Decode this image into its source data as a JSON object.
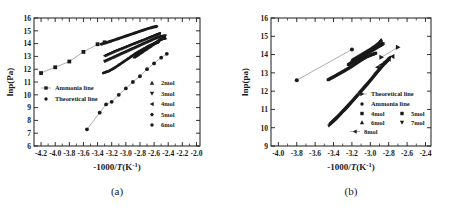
{
  "figure": {
    "panels": [
      {
        "caption": "(a)",
        "axes": {
          "xlabel_prefix": "-1000/",
          "xlabel_italic": "T",
          "xlabel_suffix_open": "(K",
          "xlabel_exp": "-1",
          "xlabel_suffix_close": ")",
          "ylabel": "lnp(Pa)",
          "xlim": [
            -4.3,
            -1.95
          ],
          "ylim": [
            6,
            16
          ],
          "xticks": [
            -4.2,
            -4.0,
            -3.8,
            -3.6,
            -3.4,
            -3.2,
            -3.0,
            -2.8,
            -2.6,
            -2.4,
            -2.2,
            -2.0
          ],
          "xticklabels": [
            "-4.2",
            "-4.0",
            "-3.8",
            "-3.6",
            "-3.4",
            "-3.2",
            "-3.0",
            "-2.8",
            "-2.6",
            "-2.4",
            "-2.2",
            "-2.0"
          ],
          "yticks": [
            6,
            7,
            8,
            9,
            10,
            11,
            12,
            13,
            14,
            15,
            16
          ],
          "yticklabels": [
            "6",
            "7",
            "8",
            "9",
            "10",
            "11",
            "12",
            "13",
            "14",
            "15",
            "16"
          ]
        },
        "legend_left": [
          {
            "label": "Ammonia line",
            "marker": "square",
            "line": true
          },
          {
            "label": "Theoretical line",
            "marker": "circle",
            "line": false
          }
        ],
        "legend_right": [
          {
            "label": "2mol",
            "marker": "triangle-up"
          },
          {
            "label": "3mol",
            "marker": "triangle-down"
          },
          {
            "label": "4mol",
            "marker": "triangle-left"
          },
          {
            "label": "5mol",
            "marker": "diamond"
          },
          {
            "label": "6mol",
            "marker": "circle"
          }
        ]
      },
      {
        "caption": "(b)",
        "axes": {
          "xlabel_prefix": "-1000/",
          "xlabel_italic": "T",
          "xlabel_suffix_open": "(K",
          "xlabel_exp": "-1",
          "xlabel_suffix_close": ")",
          "ylabel": "lnp(pa)",
          "xlim": [
            -4.08,
            -2.34
          ],
          "ylim": [
            9,
            16
          ],
          "xticks": [
            -4.0,
            -3.8,
            -3.6,
            -3.4,
            -3.2,
            -3.0,
            -2.8,
            -2.6,
            -2.4
          ],
          "xticklabels": [
            "-4.0",
            "-3.8",
            "-3.6",
            "-3.4",
            "-3.2",
            "-3.0",
            "-2.8",
            "-2.6",
            "-2.4"
          ],
          "yticks": [
            9,
            10,
            11,
            12,
            13,
            14,
            15,
            16
          ],
          "yticklabels": [
            "9",
            "10",
            "11",
            "12",
            "13",
            "14",
            "15",
            "16"
          ]
        },
        "legend_rows": [
          [
            {
              "label": "Theoretical line",
              "marker": "triangle-right",
              "line": true
            }
          ],
          [
            {
              "label": "Ammonia line",
              "marker": "circle",
              "line": false
            }
          ],
          [
            {
              "label": "4mol",
              "marker": "square"
            },
            {
              "label": "5mol",
              "marker": "square"
            }
          ],
          [
            {
              "label": "6mol",
              "marker": "triangle-up"
            },
            {
              "label": "7mol",
              "marker": "triangle-down"
            }
          ],
          [
            {
              "label": "8mol",
              "marker": "triangle-left",
              "line": true
            }
          ]
        ]
      }
    ]
  },
  "chart_data": [
    {
      "type": "scatter",
      "panel": "(a)",
      "title": "",
      "xlabel": "-1000/T(K^-1)",
      "ylabel": "lnp(Pa)",
      "xlim": [
        -4.3,
        -1.95
      ],
      "ylim": [
        6,
        16
      ],
      "grid": false,
      "legend_position": "inside-left and inside-right",
      "series": [
        {
          "name": "Ammonia line",
          "marker": "square",
          "line": true,
          "x": [
            -4.2,
            -4.0,
            -3.8,
            -3.6,
            -3.4,
            -3.3
          ],
          "y": [
            11.7,
            12.15,
            12.6,
            13.35,
            13.95,
            14.1
          ]
        },
        {
          "name": "Theoretical line",
          "marker": "circle",
          "line": true,
          "x": [
            -3.55,
            -3.37,
            -3.28,
            -3.2,
            -3.1,
            -3.0,
            -2.9,
            -2.8,
            -2.7,
            -2.6,
            -2.5,
            -2.42
          ],
          "y": [
            7.3,
            8.6,
            9.25,
            9.45,
            10.0,
            10.5,
            11.0,
            11.45,
            12.0,
            12.45,
            12.9,
            13.2
          ]
        },
        {
          "name": "2mol",
          "marker": "triangle-up",
          "line": false,
          "x": [
            -2.88,
            -2.84,
            -2.8,
            -2.76,
            -2.72,
            -2.68,
            -2.64,
            -2.6,
            -2.56,
            -2.52,
            -2.48,
            -2.44
          ],
          "y": [
            12.95,
            13.1,
            13.25,
            13.4,
            13.55,
            13.7,
            13.85,
            14.0,
            14.15,
            14.3,
            14.4,
            14.45
          ]
        },
        {
          "name": "3mol",
          "marker": "triangle-down",
          "line": false,
          "x": [
            -3.3,
            -3.22,
            -3.14,
            -3.06,
            -2.98,
            -2.9,
            -2.82,
            -2.74,
            -2.66,
            -2.58,
            -2.5,
            -2.44
          ],
          "y": [
            12.6,
            12.8,
            13.0,
            13.2,
            13.4,
            13.6,
            13.8,
            14.0,
            14.2,
            14.4,
            14.55,
            14.6
          ]
        },
        {
          "name": "4mol",
          "marker": "triangle-left",
          "line": false,
          "x": [
            -3.3,
            -3.22,
            -3.14,
            -3.06,
            -2.98,
            -2.9,
            -2.82,
            -2.74,
            -2.66,
            -2.58,
            -2.52
          ],
          "y": [
            13.05,
            13.25,
            13.45,
            13.62,
            13.8,
            13.98,
            14.15,
            14.32,
            14.5,
            14.68,
            14.8
          ]
        },
        {
          "name": "5mol",
          "marker": "diamond",
          "line": false,
          "x": [
            -3.35,
            -3.26,
            -3.18,
            -3.1,
            -3.02,
            -2.94,
            -2.86,
            -2.78,
            -2.7,
            -2.62,
            -2.56
          ],
          "y": [
            13.95,
            14.1,
            14.25,
            14.4,
            14.55,
            14.7,
            14.85,
            15.0,
            15.15,
            15.28,
            15.35
          ]
        },
        {
          "name": "6mol",
          "marker": "circle",
          "line": false,
          "x": [
            -3.32,
            -3.24,
            -3.16,
            -3.08,
            -3.0,
            -2.92,
            -2.84,
            -2.76,
            -2.68,
            -2.6,
            -2.54
          ],
          "y": [
            11.7,
            11.85,
            12.1,
            12.4,
            12.7,
            13.0,
            13.3,
            13.55,
            13.8,
            14.0,
            14.1
          ]
        }
      ]
    },
    {
      "type": "scatter",
      "panel": "(b)",
      "title": "",
      "xlabel": "-1000/T(K^-1)",
      "ylabel": "lnp(pa)",
      "xlim": [
        -4.08,
        -2.34
      ],
      "ylim": [
        9,
        16
      ],
      "grid": false,
      "legend_position": "inside-lower-right",
      "series": [
        {
          "name": "Ammonia line",
          "marker": "circle",
          "line": true,
          "x": [
            -3.8,
            -3.2
          ],
          "y": [
            12.6,
            14.28
          ]
        },
        {
          "name": "Theoretical line",
          "marker": "triangle-right",
          "line": true,
          "x": [
            -2.88,
            -2.7
          ],
          "y": [
            13.85,
            14.4
          ]
        },
        {
          "name": "4mol",
          "marker": "square",
          "line": false,
          "x": [
            -3.46,
            -3.4,
            -3.34,
            -3.28,
            -3.22,
            -3.16,
            -3.1,
            -3.04,
            -2.98,
            -2.94
          ],
          "y": [
            12.62,
            12.78,
            12.95,
            13.12,
            13.3,
            13.5,
            13.7,
            13.88,
            14.0,
            14.08
          ]
        },
        {
          "name": "5mol",
          "marker": "square",
          "line": false,
          "x": [
            -3.24,
            -3.19,
            -3.14,
            -3.09,
            -3.04,
            -2.99,
            -2.94,
            -2.89,
            -2.86
          ],
          "y": [
            13.45,
            13.6,
            13.75,
            13.9,
            14.05,
            14.2,
            14.35,
            14.5,
            14.6
          ]
        },
        {
          "name": "6mol",
          "marker": "triangle-up",
          "line": false,
          "x": [
            -3.2,
            -3.15,
            -3.1,
            -3.05,
            -3.0,
            -2.95,
            -2.9,
            -2.88
          ],
          "y": [
            13.7,
            13.85,
            14.0,
            14.15,
            14.3,
            14.48,
            14.68,
            14.8
          ]
        },
        {
          "name": "7mol",
          "marker": "triangle-down",
          "line": false,
          "x": [
            -3.45,
            -3.38,
            -3.31,
            -3.24,
            -3.17,
            -3.1,
            -3.03,
            -2.96,
            -2.9,
            -2.84,
            -2.8
          ],
          "y": [
            10.1,
            10.42,
            10.78,
            11.15,
            11.55,
            11.95,
            12.35,
            12.78,
            13.15,
            13.5,
            13.7
          ]
        },
        {
          "name": "8mol",
          "marker": "triangle-left",
          "line": false,
          "x": [
            -3.44,
            -3.37,
            -3.3,
            -3.23,
            -3.16,
            -3.09,
            -3.02,
            -2.95,
            -2.89,
            -2.83,
            -2.79
          ],
          "y": [
            10.25,
            10.58,
            10.95,
            11.32,
            11.72,
            12.12,
            12.52,
            12.95,
            13.3,
            13.65,
            13.85
          ]
        },
        {
          "name": "8mol-upper",
          "marker": "triangle-left",
          "line": false,
          "x": [
            -2.92,
            -2.88,
            -2.84,
            -2.8,
            -2.76
          ],
          "y": [
            13.3,
            13.45,
            13.6,
            13.75,
            13.9
          ]
        }
      ]
    }
  ]
}
